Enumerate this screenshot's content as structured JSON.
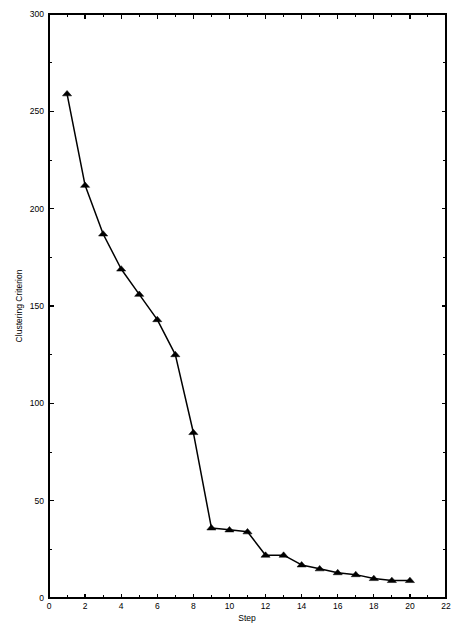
{
  "chart_data": {
    "type": "line",
    "title": "",
    "subtitle": "",
    "xlabel": "Step",
    "ylabel": "Clustering Criterion",
    "xlim": [
      0,
      22
    ],
    "ylim": [
      0,
      300
    ],
    "x_major_ticks": [
      0,
      2,
      4,
      6,
      8,
      10,
      12,
      14,
      16,
      18,
      20,
      22
    ],
    "x_minor_ticks": [
      1,
      3,
      5,
      7,
      9,
      11,
      13,
      15,
      17,
      19,
      21
    ],
    "y_major_ticks": [
      0,
      50,
      100,
      150,
      200,
      250,
      300
    ],
    "y_minor_ticks": [
      25,
      75,
      125,
      175,
      225,
      275
    ],
    "x_tick_labels": [
      "0",
      "2",
      "4",
      "6",
      "8",
      "10",
      "12",
      "14",
      "16",
      "18",
      "20",
      "22"
    ],
    "y_tick_labels": [
      "0",
      "50",
      "100",
      "150",
      "200",
      "250",
      "300"
    ],
    "grid": false,
    "legend": false,
    "legend_position": "none",
    "marker": "triangle-up",
    "marker_color": "#000000",
    "line_color": "#000000",
    "background_color": "#ffffff",
    "frame": true,
    "x": [
      1,
      2,
      3,
      4,
      5,
      6,
      7,
      8,
      9,
      10,
      11,
      12,
      13,
      14,
      15,
      16,
      17,
      18,
      19,
      20
    ],
    "values": [
      259,
      212,
      187,
      169,
      156,
      143,
      125,
      85,
      36,
      35,
      34,
      22,
      22,
      17,
      15,
      13,
      12,
      10,
      9,
      9
    ],
    "series": [
      {
        "name": "Clustering Criterion",
        "values": [
          259,
          212,
          187,
          169,
          156,
          143,
          125,
          85,
          36,
          35,
          34,
          22,
          22,
          17,
          15,
          13,
          12,
          10,
          9,
          9
        ]
      }
    ]
  },
  "figure": {
    "plot_left": 49,
    "plot_right": 446,
    "plot_top": 14,
    "plot_bottom": 598
  }
}
